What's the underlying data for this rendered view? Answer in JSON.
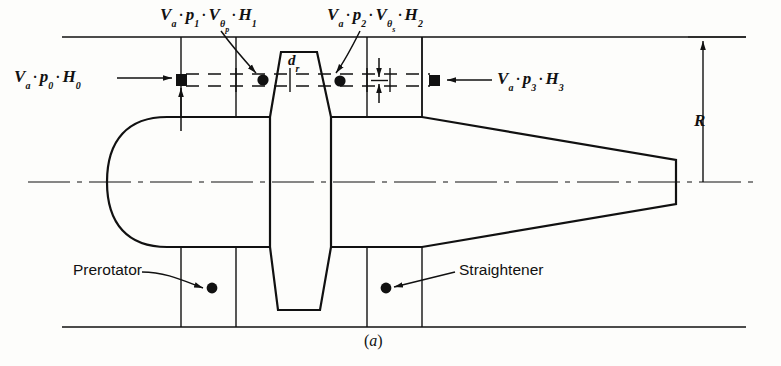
{
  "figure": {
    "caption": "(a)",
    "type": "engineering-cross-section"
  },
  "labels": {
    "station0": {
      "V": "V",
      "Vsub": "a",
      "dot1": "·",
      "p": "p",
      "psub": "0",
      "dot2": "·",
      "H": "H",
      "Hsub": "0",
      "text": "Va · p0 · H0"
    },
    "station1": {
      "V": "V",
      "Vsub": "a",
      "dot1": "·",
      "p": "p",
      "psub": "1",
      "dot2": "·",
      "Vt": "V",
      "Vtsub": "θ",
      "Vtsub2": "p",
      "dot3": "·",
      "H": "H",
      "Hsub": "1",
      "text": "Va · p1 · Vθp · H1"
    },
    "station2": {
      "V": "V",
      "Vsub": "a",
      "dot1": "·",
      "p": "p",
      "psub": "2",
      "dot2": "·",
      "Vt": "V",
      "Vtsub": "θ",
      "Vtsub2": "s",
      "dot3": "·",
      "H": "H",
      "Hsub": "2",
      "text": "Va · p2 · Vθs · H2"
    },
    "station3": {
      "V": "V",
      "Vsub": "a",
      "dot1": "·",
      "p": "p",
      "psub": "3",
      "dot2": "·",
      "H": "H",
      "Hsub": "3",
      "text": "Va · p3 · H3"
    },
    "prerotator": "Prerotator",
    "straightener": "Straightener",
    "radius": "R",
    "rotor_diameter": {
      "sym": "d",
      "sub": "r",
      "text": "dr"
    }
  },
  "colors": {
    "ink": "#111111",
    "paper": "#fdfdfb",
    "thin": "#333333"
  },
  "geometry": {
    "duct_top_y": 37,
    "duct_bottom_y": 327,
    "centerline_y": 182,
    "duct_left_x": 62,
    "duct_right_x": 745,
    "station_marker_xs": [
      181,
      263,
      340,
      434
    ],
    "streamline_y": 80,
    "hub_top_y": 117,
    "hub_bottom_y": 247,
    "tail_tip_x": 676,
    "rotor_center_x": 303
  }
}
